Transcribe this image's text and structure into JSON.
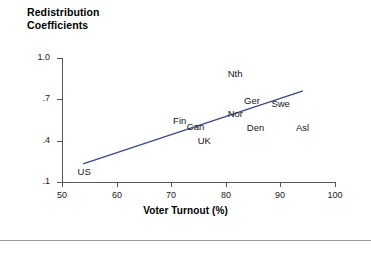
{
  "chart_data": {
    "type": "scatter",
    "title_line1": "Redistribution",
    "title_line2": "Coefficients",
    "xlabel": "Voter Turnout (%)",
    "ylabel": "Redistribution Coefficients",
    "xlim": [
      50,
      100
    ],
    "ylim": [
      0.1,
      1.0
    ],
    "grid": false,
    "legend": "none",
    "xticks": [
      50,
      60,
      70,
      80,
      90,
      100
    ],
    "xtick_labels": [
      "50",
      "60",
      "70",
      "80",
      "90",
      "100"
    ],
    "yticks": [
      1.0,
      0.7,
      0.4,
      0.1
    ],
    "ytick_labels": [
      "1.0",
      ".7",
      ".4",
      ".1"
    ],
    "point_label_color": "#15151a",
    "trendline_color": "#3b4a80",
    "axis_color": "#58585a",
    "points": [
      {
        "label": "US",
        "x": 54.5,
        "y": 0.175
      },
      {
        "label": "Fin",
        "x": 72.0,
        "y": 0.545
      },
      {
        "label": "Can",
        "x": 74.5,
        "y": 0.5
      },
      {
        "label": "UK",
        "x": 76.5,
        "y": 0.4
      },
      {
        "label": "Nth",
        "x": 82.0,
        "y": 0.885
      },
      {
        "label": "Nor",
        "x": 82.0,
        "y": 0.595
      },
      {
        "label": "Ger",
        "x": 85.0,
        "y": 0.69
      },
      {
        "label": "Den",
        "x": 85.5,
        "y": 0.49
      },
      {
        "label": "Swe",
        "x": 90.0,
        "y": 0.665
      },
      {
        "label": "Asl",
        "x": 94.5,
        "y": 0.49
      }
    ],
    "trendline": {
      "x0": 54.0,
      "y0": 0.233,
      "x1": 94.0,
      "y1": 0.76
    }
  }
}
